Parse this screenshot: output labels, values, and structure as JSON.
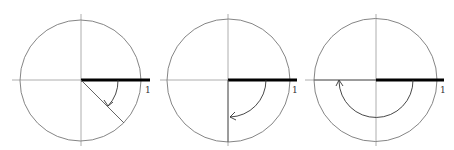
{
  "diagrams": [
    {
      "name": "angle-negative-45",
      "center": [
        80.5,
        80
      ],
      "radius": 60.5,
      "ray_angle_deg": -45,
      "arc_radius": 37,
      "unit_label": "1"
    },
    {
      "name": "angle-negative-90",
      "center": [
        228,
        80
      ],
      "radius": 61,
      "ray_angle_deg": -90,
      "arc_radius": 37,
      "unit_label": "1"
    },
    {
      "name": "angle-negative-180",
      "center": [
        376,
        80
      ],
      "radius": 61,
      "ray_angle_deg": -180,
      "arc_radius": 37,
      "unit_label": "1"
    }
  ],
  "colors": {
    "circle": "#777777",
    "axis": "#999999",
    "unit_bar": "#000000",
    "ray": "#555555",
    "arc": "#333333"
  }
}
